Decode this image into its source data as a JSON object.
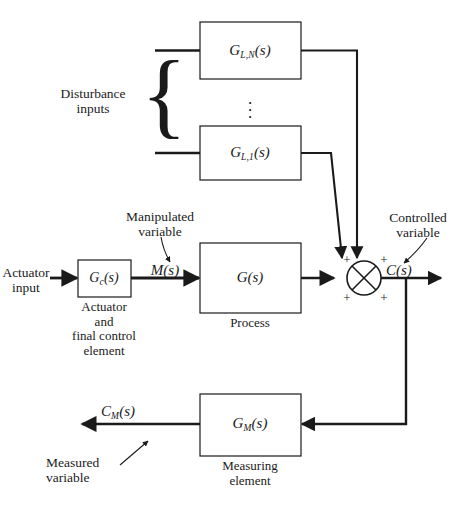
{
  "figure": {
    "type": "control-system-block-diagram",
    "background": "#ffffff",
    "line_color": "#1a1a1a"
  },
  "blocks": {
    "disturbance_n": {
      "label": "G",
      "sub": "L,N",
      "arg": "(s)"
    },
    "disturbance_1": {
      "label": "G",
      "sub": "L,1",
      "arg": "(s)"
    },
    "actuator": {
      "label": "G",
      "sub": "c",
      "arg": "(s)",
      "caption_line1": "Actuator",
      "caption_line2": "and",
      "caption_line3": "final control",
      "caption_line4": "element"
    },
    "process": {
      "label": "G",
      "sub": "",
      "arg": "(s)",
      "caption": "Process"
    },
    "measuring": {
      "label": "G",
      "sub": "M",
      "arg": "(s)",
      "caption_line1": "Measuring",
      "caption_line2": "element"
    }
  },
  "signals": {
    "actuator_input_line1": "Actuator",
    "actuator_input_line2": "input",
    "manipulated_line1": "Manipulated",
    "manipulated_line2": "variable",
    "manipulated_symbol": "M",
    "manipulated_arg": "(s)",
    "controlled_line1": "Controlled",
    "controlled_line2": "variable",
    "controlled_symbol": "C",
    "controlled_arg": "(s)",
    "measured_line1": "Measured",
    "measured_line2": "variable",
    "measured_symbol": "C",
    "measured_sub": "M",
    "measured_arg": "(s)",
    "disturbance_line1": "Disturbance",
    "disturbance_line2": "inputs"
  },
  "summing_junction": {
    "name": "summing-junction",
    "signs": [
      "+",
      "+",
      "+",
      "+"
    ]
  },
  "ellipsis": "⋮"
}
